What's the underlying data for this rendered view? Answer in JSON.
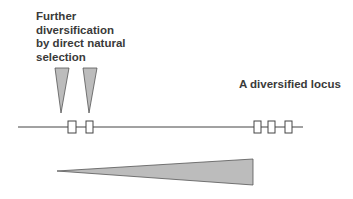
{
  "labels": {
    "further_line1": "Further",
    "further_line2": "diversification",
    "further_line3": "by direct natural",
    "further_line4": "selection",
    "locus": "A diversified locus"
  },
  "colors": {
    "fill": "#bcbcbc",
    "stroke": "#555555",
    "text": "#3a3a3a"
  }
}
